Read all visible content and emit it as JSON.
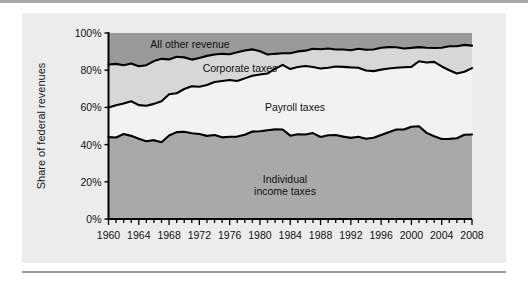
{
  "chart_data": {
    "type": "area",
    "stacked": true,
    "title": "",
    "subtitle": "",
    "xlabel": "",
    "ylabel": "Share of federal revenues",
    "xlim": [
      1960,
      2008
    ],
    "ylim": [
      0,
      100
    ],
    "grid": false,
    "legend_position": "inline-annotations",
    "ytick_labels": [
      "0%",
      "20%",
      "40%",
      "60%",
      "80%",
      "100%"
    ],
    "ytick_values": [
      0,
      20,
      40,
      60,
      80,
      100
    ],
    "xtick_labels": [
      "1960",
      "1964",
      "1968",
      "1972",
      "1976",
      "1980",
      "1984",
      "1988",
      "1992",
      "1996",
      "2000",
      "2004",
      "2008"
    ],
    "xtick_values": [
      1960,
      1964,
      1968,
      1972,
      1976,
      1980,
      1984,
      1988,
      1992,
      1996,
      2000,
      2004,
      2008
    ],
    "minor_tick_interval": 1,
    "x": [
      1960,
      1961,
      1962,
      1963,
      1964,
      1965,
      1966,
      1967,
      1968,
      1969,
      1970,
      1971,
      1972,
      1973,
      1974,
      1975,
      1976,
      1977,
      1978,
      1979,
      1980,
      1981,
      1982,
      1983,
      1984,
      1985,
      1986,
      1987,
      1988,
      1989,
      1990,
      1991,
      1992,
      1993,
      1994,
      1995,
      1996,
      1997,
      1998,
      1999,
      2000,
      2001,
      2002,
      2003,
      2004,
      2005,
      2006,
      2007,
      2008
    ],
    "series": [
      {
        "name": "Individual income taxes",
        "color": "#a9a9a9",
        "label_lines": [
          "Individual",
          "income taxes"
        ],
        "values": [
          44.0,
          43.8,
          45.7,
          44.7,
          43.2,
          41.8,
          42.4,
          41.3,
          44.9,
          46.7,
          46.9,
          46.1,
          45.7,
          44.7,
          45.2,
          43.9,
          44.2,
          44.3,
          45.3,
          47.0,
          47.2,
          47.7,
          48.2,
          48.1,
          44.8,
          45.6,
          45.4,
          46.2,
          44.1,
          45.0,
          45.2,
          44.3,
          43.6,
          44.2,
          43.1,
          43.7,
          45.2,
          46.7,
          48.1,
          48.1,
          49.6,
          49.9,
          46.3,
          44.5,
          43.0,
          43.1,
          43.4,
          45.3,
          45.4
        ]
      },
      {
        "name": "Payroll taxes",
        "color": "#f2f2f2",
        "label_lines": [
          "Payroll taxes"
        ],
        "values": [
          15.9,
          17.4,
          16.4,
          18.6,
          18.0,
          19.1,
          19.5,
          22.0,
          22.2,
          20.9,
          23.0,
          25.3,
          25.4,
          27.3,
          28.5,
          30.3,
          30.5,
          29.9,
          30.3,
          30.0,
          30.5,
          30.5,
          32.6,
          34.8,
          35.8,
          36.1,
          36.9,
          35.5,
          36.8,
          36.3,
          36.8,
          37.5,
          37.9,
          37.1,
          36.7,
          35.8,
          35.1,
          34.2,
          33.2,
          33.5,
          32.2,
          34.9,
          37.8,
          40.0,
          39.0,
          36.9,
          34.8,
          33.9,
          35.7
        ]
      },
      {
        "name": "Corporate taxes",
        "color": "#d7d7d7",
        "label_lines": [
          "Corporate taxes"
        ],
        "values": [
          23.2,
          22.2,
          20.6,
          20.3,
          20.9,
          21.8,
          23.0,
          22.8,
          18.7,
          19.6,
          17.0,
          14.3,
          15.5,
          15.7,
          14.7,
          14.6,
          13.9,
          15.4,
          15.0,
          14.2,
          12.5,
          10.2,
          8.0,
          6.2,
          8.5,
          8.4,
          8.2,
          9.8,
          10.4,
          10.4,
          9.1,
          9.3,
          9.2,
          10.2,
          11.2,
          11.6,
          11.8,
          11.5,
          11.0,
          10.1,
          10.2,
          7.6,
          8.0,
          7.4,
          10.1,
          12.9,
          14.7,
          14.4,
          12.1
        ]
      },
      {
        "name": "All other revenue",
        "color": "#9a9a9a",
        "label_lines": [
          "All other revenue"
        ],
        "values": [
          16.9,
          16.6,
          17.3,
          16.4,
          17.9,
          17.3,
          15.1,
          13.9,
          14.2,
          12.8,
          13.1,
          14.3,
          13.4,
          12.3,
          11.6,
          11.2,
          11.4,
          10.4,
          9.4,
          8.8,
          9.8,
          11.6,
          11.2,
          10.9,
          10.9,
          9.9,
          9.5,
          8.5,
          8.7,
          8.3,
          8.9,
          8.9,
          9.3,
          8.5,
          9.0,
          8.9,
          7.9,
          7.6,
          7.7,
          8.3,
          8.0,
          7.6,
          7.9,
          8.1,
          7.9,
          7.1,
          7.1,
          6.4,
          6.8
        ]
      }
    ],
    "boundary_labels_top_to_bottom": [
      "All other revenue",
      "Corporate taxes",
      "Payroll taxes",
      "Individual income taxes"
    ]
  },
  "axis": {
    "y_title": "Share of federal revenues"
  },
  "colors": {
    "page_background": "#ffffff",
    "panel_background": "#ececec",
    "top_rule": "#a8a8a8",
    "bottom_rule": "#9b9b9b",
    "line": "#000000",
    "individual_income_taxes": "#a9a9a9",
    "payroll_taxes": "#f2f2f2",
    "corporate_taxes": "#d7d7d7",
    "all_other_revenue": "#9a9a9a"
  }
}
